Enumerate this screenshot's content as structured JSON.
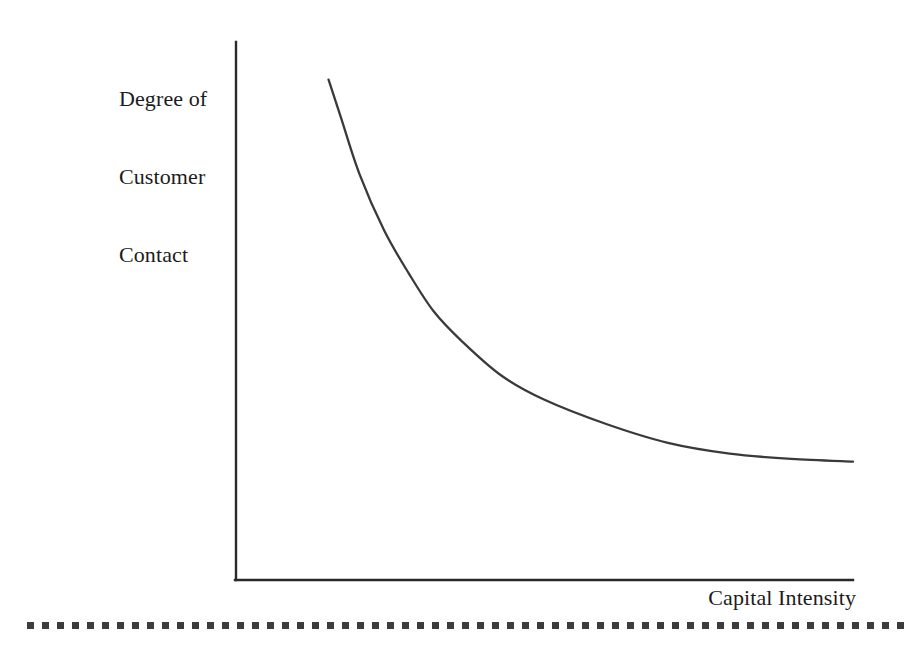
{
  "figure": {
    "background_color": "#ffffff",
    "axis_color": "#2a2a2a",
    "curve_color": "#3a3a3a",
    "rule_color": "#3c3c3c"
  },
  "axes": {
    "y_label_lines": [
      "Degree of",
      "Customer",
      "Contact"
    ],
    "y_label_text": "Degree of Customer Contact",
    "x_label_text": "Capital Intensity"
  },
  "chart_data": {
    "type": "line",
    "title": "",
    "subtitle": "",
    "xlabel": "Capital Intensity",
    "ylabel": "Degree of Customer Contact",
    "xlim": [
      0,
      10
    ],
    "ylim": [
      0,
      10
    ],
    "grid": false,
    "legend": null,
    "axis_ticks": {
      "x": [],
      "y": []
    },
    "annotations": [],
    "series": [
      {
        "name": "Degree of Customer Contact vs Capital Intensity",
        "style": "smooth-curve",
        "description": "Inverse (hyperbolic) relationship: high customer contact at low capital intensity, decaying asymptotically toward a low plateau as capital intensity rises",
        "x": [
          1.5,
          1.7,
          2.0,
          2.4,
          2.8,
          3.2,
          3.65,
          4.3,
          5.0,
          6.0,
          7.0,
          8.0,
          9.0,
          10.0
        ],
        "y": [
          9.3,
          8.6,
          7.55,
          6.5,
          5.7,
          5.0,
          4.45,
          3.8,
          3.35,
          2.9,
          2.55,
          2.35,
          2.25,
          2.2
        ]
      }
    ]
  },
  "rule": {
    "style": "square-dotted",
    "dot_size_px": 7,
    "dot_period_px": 15,
    "dot_count": 59
  }
}
